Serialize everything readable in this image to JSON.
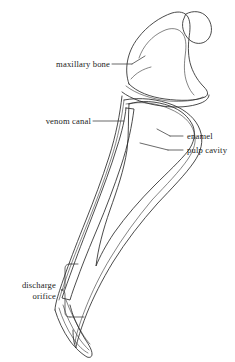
{
  "figure": {
    "background_color": "#ffffff",
    "width": 235,
    "height": 362
  },
  "labels": {
    "maxillary_bone": "maxillary bone",
    "venom_canal": "venom canal",
    "enamel": "enamel",
    "pulp_cavity": "pulp cavity",
    "discharge_orifice_line1": "discharge",
    "discharge_orifice_line2": "orifice"
  },
  "colors": {
    "ink": "#2b2b2b",
    "text": "#1c1c1c",
    "bone_stipple": "#6e6e6e",
    "pulp_fill": "#d9d9d9",
    "pulp_stipple": "#9a9a9a",
    "canal_hatch": "#3a3a3a",
    "background": "#ffffff"
  },
  "structures": [
    {
      "name": "maxillary-bone",
      "label": "maxillary bone",
      "fill_style": "stippled",
      "fill_color": "#fdfdfd",
      "position": "upper-right"
    },
    {
      "name": "venom-canal",
      "label": "venom canal",
      "fill_style": "diagonal-hatched",
      "position": "left-anterior-edge"
    },
    {
      "name": "enamel",
      "label": "enamel",
      "fill_style": "outline-only",
      "position": "outer-posterior-layer"
    },
    {
      "name": "pulp-cavity",
      "label": "pulp cavity",
      "fill_style": "gray-mottled",
      "fill_color": "#d9d9d9",
      "position": "fang-core"
    },
    {
      "name": "discharge-orifice",
      "label": "discharge orifice",
      "fill_style": "bracketed-region",
      "position": "lower-fang-anterior"
    }
  ]
}
